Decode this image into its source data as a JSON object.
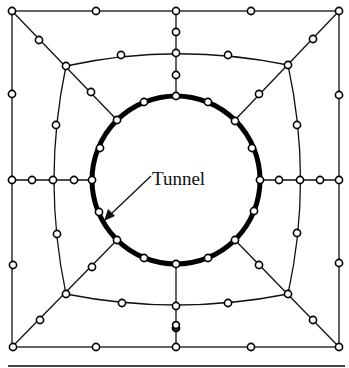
{
  "diagram": {
    "labels": {
      "tunnel": "Tunnel"
    },
    "colors": {
      "lines": "#111111",
      "tunnel_ring": "#000000",
      "node_fill": "#ffffff",
      "background": "#ffffff"
    },
    "tunnel": {
      "cx": 176,
      "cy": 180,
      "r": 84
    },
    "outer_boundary": {
      "x1": 12,
      "y1": 11,
      "x2": 339,
      "y2": 347
    },
    "inner_ring_corners": [
      [
        66,
        66
      ],
      [
        288,
        65
      ],
      [
        288,
        294
      ],
      [
        66,
        294
      ]
    ],
    "node_count_description": "Mesh nodes on outer square, inner curved square, radial lines and tunnel ring"
  }
}
